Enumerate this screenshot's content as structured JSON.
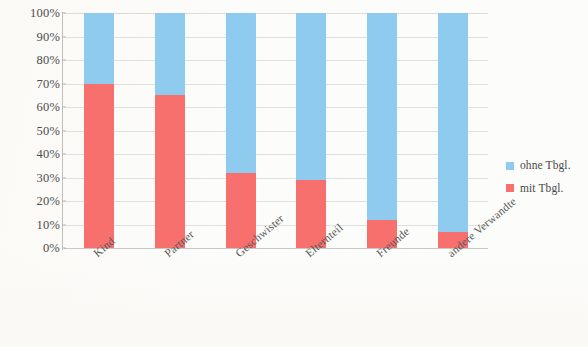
{
  "chart_data": {
    "type": "bar",
    "subtype": "stacked-100-percent",
    "title": "",
    "subtitle": "",
    "xlabel": "",
    "ylabel": "",
    "categories": [
      "Kind",
      "Partner",
      "Geschwister",
      "Elternteil",
      "Freunde",
      "andere Verwandte"
    ],
    "series": [
      {
        "name": "mit Tbgl.",
        "color": "#f8706e",
        "values": [
          70,
          65,
          32,
          29,
          12,
          7
        ]
      },
      {
        "name": "ohne Tbgl.",
        "color": "#8ecbee",
        "values": [
          30,
          35,
          68,
          71,
          88,
          93
        ]
      }
    ],
    "ylim": [
      0,
      100
    ],
    "ytick_values": [
      0,
      10,
      20,
      30,
      40,
      50,
      60,
      70,
      80,
      90,
      100
    ],
    "ytick_labels": [
      "0%",
      "10%",
      "20%",
      "30%",
      "40%",
      "50%",
      "60%",
      "70%",
      "80%",
      "90%",
      "100%"
    ],
    "grid": true,
    "grid_axis": "y",
    "legend_position": "right",
    "value_suffix": "%"
  },
  "legend": {
    "entries": [
      {
        "label": "ohne Tbgl.",
        "color": "#8ecbee"
      },
      {
        "label": "mit Tbgl.",
        "color": "#f8706e"
      }
    ]
  },
  "colors": {
    "series_blue": "#8ecbee",
    "series_red": "#f8706e",
    "grid": "#bebebc",
    "axis": "#a5a5a3",
    "tick_text": "#4d4d4d",
    "background": "#fcfcfa"
  }
}
